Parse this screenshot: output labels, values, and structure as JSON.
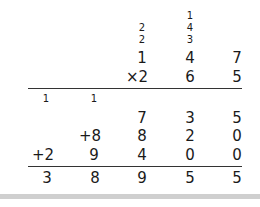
{
  "problem": {
    "top_carries": {
      "col3": [
        "",
        "2",
        "2"
      ],
      "col4": [
        "1",
        "4",
        "3"
      ]
    },
    "multiplicand": [
      "",
      "",
      "1",
      "4",
      "7"
    ],
    "multiplier": [
      "",
      "",
      "×2",
      "6",
      "5"
    ],
    "sum_carries": [
      "1",
      "1",
      "",
      "",
      ""
    ],
    "partial_1": [
      "",
      "",
      "7",
      "3",
      "5"
    ],
    "partial_2": [
      "",
      "+8",
      "8",
      "2",
      "0"
    ],
    "partial_3": [
      "+2",
      "9",
      "4",
      "0",
      "0"
    ],
    "result": [
      "3",
      "8",
      "9",
      "5",
      "5"
    ]
  },
  "colors": {
    "text": "#1a1a1a",
    "rule": "#333333",
    "footer_bar": "#cfcfcf"
  }
}
